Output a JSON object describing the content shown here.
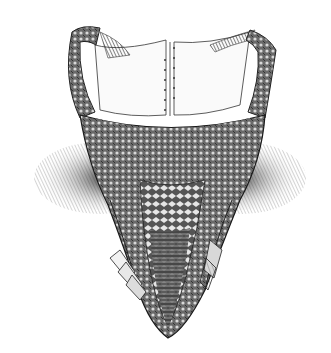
{
  "image": {
    "subject": "engraved illustration of an embroidered corset bodice",
    "style": "black and white line engraving",
    "background_color": "#ffffff",
    "ink_color": "#1a1a1a",
    "width": 331,
    "height": 353
  }
}
